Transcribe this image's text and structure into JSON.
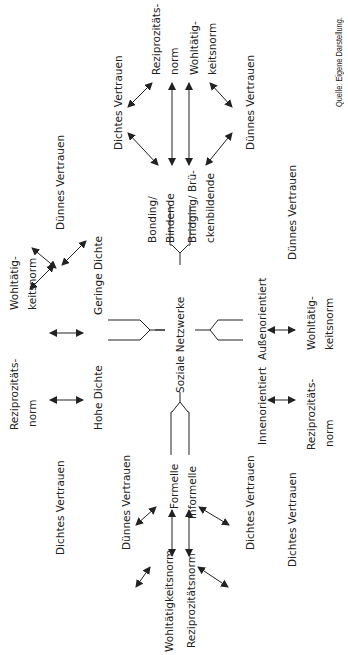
{
  "diagram": {
    "center": "Soziale Netzwerke",
    "source": "Quelle: Eigene Darstellung.",
    "branches": {
      "top": {
        "a": [
          "Bonding/",
          "Bindende"
        ],
        "b": [
          "Bridging/ Brü-",
          "ckenbildende"
        ],
        "trust_a": "Dichtes Vertrauen",
        "trust_b": "Dünnes Vertrauen",
        "norm_a": [
          "Reziprozitäts-",
          "norm"
        ],
        "norm_b": [
          "Wohltätig-",
          "keitsnorm"
        ]
      },
      "left": {
        "a": "Hohe Dichte",
        "b": "Geringe Dichte",
        "trust_a": "Dichtes Vertrauen",
        "trust_b": "Dünnes Vertrauen",
        "norm_a": [
          "Reziprozitäts-",
          "norm"
        ],
        "norm_b": [
          "Wohltätig-",
          "keitsnorm"
        ]
      },
      "bottom": {
        "a": "Formelle",
        "b": "Informelle",
        "trust_a": "Dünnes Vertrauen",
        "trust_b": "Dichtes Vertrauen",
        "norm_a": "Wohltätigkeitsnorm",
        "norm_b": "Reziprozitätsnorm"
      },
      "right": {
        "a": "Innenorientiert",
        "b": "Außenorientiert",
        "trust_a": "Dichtes Vertrauen",
        "trust_b": "Dünnes Vertrauen",
        "norm_a": [
          "Reziprozitäts-",
          "norm"
        ],
        "norm_b": [
          "Wohltätig-",
          "keitsnorm"
        ]
      }
    },
    "colors": {
      "line": "#222222",
      "text": "#222222",
      "background": "#ffffff"
    }
  }
}
